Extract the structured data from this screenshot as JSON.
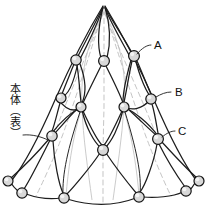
{
  "figure": {
    "type": "technical-line-drawing",
    "title": "",
    "background_color": "#ffffff",
    "line_color": "#1d1d1d",
    "guide_color": "#bdbdbd",
    "node_fill": "#d8d8d8",
    "node_stroke": "#141414",
    "width": 205,
    "height": 212
  },
  "annotations": {
    "body_label": {
      "text": "本体（表）",
      "orientation": "vertical",
      "meaning": "main-body-front"
    },
    "callouts": [
      {
        "id": "A",
        "label": "A",
        "target_x": 137,
        "target_y": 53,
        "label_x": 152,
        "label_y": 48
      },
      {
        "id": "B",
        "label": "B",
        "target_x": 155,
        "target_y": 98,
        "label_x": 173,
        "label_y": 94
      },
      {
        "id": "C",
        "label": "C",
        "target_x": 160,
        "target_y": 138,
        "label_x": 176,
        "label_y": 133
      }
    ]
  },
  "nodes": [
    {
      "id": "apex",
      "x": 104,
      "y": 6,
      "r": 0
    },
    {
      "id": "r1-left",
      "x": 76,
      "y": 60,
      "r": 5.2
    },
    {
      "id": "r1-center",
      "x": 104,
      "y": 61,
      "r": 5.4
    },
    {
      "id": "r1-right",
      "x": 134,
      "y": 56,
      "r": 5.4
    },
    {
      "id": "r2-outer-left",
      "x": 61,
      "y": 98,
      "r": 5.0
    },
    {
      "id": "r2-left",
      "x": 81,
      "y": 107,
      "r": 5.0
    },
    {
      "id": "r2-right",
      "x": 124,
      "y": 107,
      "r": 5.0
    },
    {
      "id": "r2-outer-right",
      "x": 151,
      "y": 99,
      "r": 5.2
    },
    {
      "id": "r3-left",
      "x": 52,
      "y": 136,
      "r": 5.2
    },
    {
      "id": "r3-center",
      "x": 103,
      "y": 150,
      "r": 5.4
    },
    {
      "id": "r3-right",
      "x": 158,
      "y": 139,
      "r": 5.4
    },
    {
      "id": "b-far-left",
      "x": 8,
      "y": 181,
      "r": 5.0
    },
    {
      "id": "b-left",
      "x": 22,
      "y": 193,
      "r": 5.2
    },
    {
      "id": "b-mid-left",
      "x": 64,
      "y": 198,
      "r": 5.2
    },
    {
      "id": "b-mid-right",
      "x": 139,
      "y": 197,
      "r": 5.2
    },
    {
      "id": "b-right",
      "x": 186,
      "y": 191,
      "r": 5.2
    },
    {
      "id": "b-far-right",
      "x": 199,
      "y": 181,
      "r": 5.0
    }
  ]
}
